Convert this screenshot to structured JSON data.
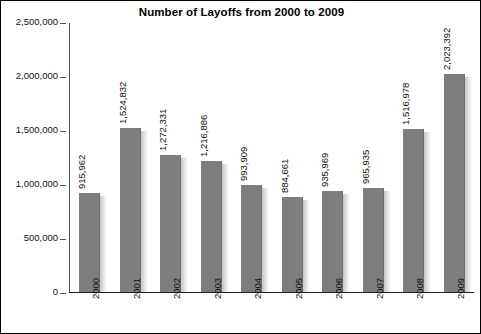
{
  "chart_data": {
    "type": "bar",
    "title": "Number of Layoffs from 2000 to 2009",
    "xlabel": "",
    "ylabel": "",
    "categories": [
      "2000",
      "2001",
      "2002",
      "2003",
      "2004",
      "2005",
      "2006",
      "2007",
      "2008",
      "2009"
    ],
    "values": [
      915962,
      1524832,
      1272331,
      1216886,
      993909,
      884661,
      935969,
      965935,
      1516978,
      2023392
    ],
    "value_labels": [
      "915,962",
      "1,524,832",
      "1,272,331",
      "1,216,886",
      "993,909",
      "884,661",
      "935,969",
      "965,935",
      "1,516,978",
      "2,023,392"
    ],
    "ylim": [
      0,
      2500000
    ],
    "ytick_values": [
      0,
      500000,
      1000000,
      1500000,
      2000000,
      2500000
    ],
    "ytick_labels": [
      "0",
      "500,000",
      "1,000,000",
      "1,500,000",
      "2,000,000",
      "2,500,000"
    ],
    "grid": false,
    "legend": false,
    "bar_color": "#7e7e7e",
    "axis_color": "#555555",
    "text_color": "#111111"
  },
  "figure": {
    "top_remnant": "",
    "border_color": "#000000",
    "background": "#ffffff"
  }
}
